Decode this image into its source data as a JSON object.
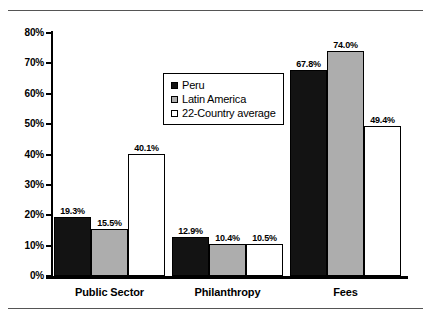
{
  "chart_data": {
    "type": "bar",
    "title": "",
    "subtitle": "",
    "xlabel": "",
    "ylabel": "",
    "categories": [
      "Public Sector",
      "Philanthropy",
      "Fees"
    ],
    "series": [
      {
        "name": "Peru",
        "color": "#131313",
        "values": [
          19.3,
          12.9,
          67.8
        ],
        "labels": [
          "19.3%",
          "12.9%",
          "67.8%"
        ]
      },
      {
        "name": "Latin America",
        "color": "#adadad",
        "values": [
          15.5,
          10.4,
          74.0
        ],
        "labels": [
          "15.5%",
          "10.4%",
          "74.0%"
        ]
      },
      {
        "name": "22-Country average",
        "color": "#ffffff",
        "values": [
          40.1,
          10.5,
          49.4
        ],
        "labels": [
          "40.1%",
          "10.5%",
          "49.4%"
        ]
      }
    ],
    "ylim": [
      0,
      80
    ],
    "ytick_values": [
      80,
      70,
      60,
      50,
      40,
      30,
      20,
      10,
      0
    ],
    "ytick_labels": [
      "80%",
      "70%",
      "60%",
      "50%",
      "40%",
      "30%",
      "20%",
      "10%",
      "0%"
    ],
    "grid": false,
    "legend_position": "upper-center"
  },
  "legend": {
    "items": [
      {
        "label": "Peru"
      },
      {
        "label": "Latin America"
      },
      {
        "label": "22-Country average"
      }
    ]
  },
  "colors": {
    "series_peru": "#131313",
    "series_latin_america": "#adadad",
    "series_22_country_average": "#ffffff",
    "axis": "#000000",
    "rule": "#555555"
  }
}
